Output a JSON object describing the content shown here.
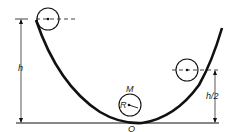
{
  "diagram": {
    "title": "",
    "labels": {
      "h": "h",
      "h_half": "h/2",
      "mass": "M",
      "radius": "R",
      "origin": "O"
    },
    "colors": {
      "stroke": "#111111",
      "background": "#ffffff"
    },
    "elements": [
      "parabolic track",
      "ball at top-left at height h",
      "ball at right at height h/2",
      "ball at bottom at origin O with mass M and radius R",
      "height dimension arrow h",
      "height dimension arrow h/2",
      "ground line"
    ]
  }
}
